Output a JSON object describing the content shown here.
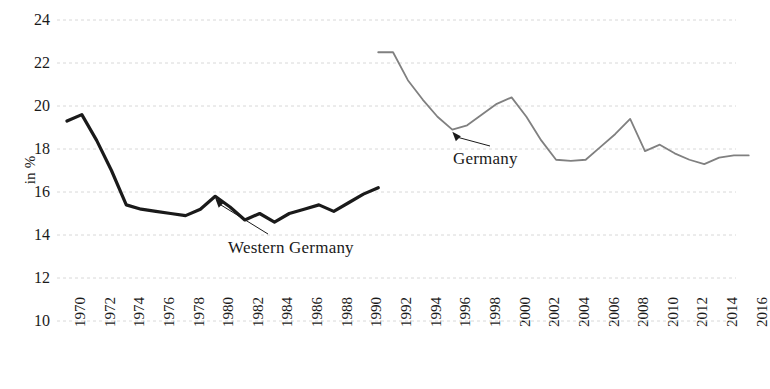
{
  "chart_data": {
    "type": "line",
    "title": "",
    "xlabel": "",
    "ylabel": "in %",
    "xlim": [
      1970,
      2016
    ],
    "ylim": [
      10,
      24
    ],
    "grid": true,
    "grid_axis": "y",
    "legend": "inline-annotations",
    "y_ticks": [
      24,
      22,
      20,
      18,
      16,
      14,
      12,
      10
    ],
    "x_ticks": [
      1970,
      1972,
      1974,
      1976,
      1978,
      1980,
      1982,
      1984,
      1986,
      1988,
      1990,
      1992,
      1994,
      1996,
      1998,
      2000,
      2002,
      2004,
      2006,
      2008,
      2010,
      2012,
      2014,
      2016
    ],
    "series": [
      {
        "name": "Western Germany",
        "color": "#1a1a1a",
        "width": 3.2,
        "x": [
          1970,
          1971,
          1972,
          1973,
          1974,
          1975,
          1976,
          1977,
          1978,
          1979,
          1980,
          1981,
          1982,
          1983,
          1984,
          1985,
          1986,
          1987,
          1988,
          1989,
          1990,
          1991
        ],
        "values": [
          19.3,
          19.6,
          18.4,
          17.0,
          15.4,
          15.2,
          15.1,
          15.0,
          14.9,
          15.2,
          15.8,
          15.3,
          14.7,
          15.0,
          14.6,
          15.0,
          15.2,
          15.4,
          15.1,
          15.5,
          15.9,
          16.2
        ]
      },
      {
        "name": "Germany",
        "color": "#808080",
        "width": 1.8,
        "x": [
          1991,
          1992,
          1993,
          1994,
          1995,
          1996,
          1997,
          1998,
          1999,
          2000,
          2001,
          2002,
          2003,
          2004,
          2005,
          2006,
          2007,
          2008,
          2009,
          2010,
          2011,
          2012,
          2013,
          2014,
          2015,
          2016
        ],
        "values": [
          22.5,
          22.5,
          21.2,
          20.3,
          19.5,
          18.9,
          19.1,
          19.6,
          20.1,
          20.4,
          19.5,
          18.4,
          17.5,
          17.45,
          17.5,
          18.1,
          18.7,
          19.4,
          17.9,
          18.2,
          17.8,
          17.5,
          17.3,
          17.6,
          17.7,
          17.7
        ]
      }
    ],
    "annotations": [
      {
        "text": "Western Germany",
        "points_to_year": 1980,
        "points_to_value": 15.8,
        "series": "Western Germany"
      },
      {
        "text": "Germany",
        "points_to_year": 1996,
        "points_to_value": 18.9,
        "series": "Germany"
      }
    ]
  },
  "axes": {
    "y_title": "in %",
    "y_tick_labels": [
      "24",
      "22",
      "20",
      "18",
      "16",
      "14",
      "12",
      "10"
    ],
    "x_tick_labels": [
      "1970",
      "1972",
      "1974",
      "1976",
      "1978",
      "1980",
      "1982",
      "1984",
      "1986",
      "1988",
      "1990",
      "1992",
      "1994",
      "1996",
      "1998",
      "2000",
      "2002",
      "2004",
      "2006",
      "2008",
      "2010",
      "2012",
      "2014",
      "2016"
    ]
  },
  "annotations": {
    "western_germany": "Western Germany",
    "germany": "Germany"
  },
  "colors": {
    "western_germany_line": "#1a1a1a",
    "germany_line": "#808080",
    "gridline": "#d8d8d8",
    "text": "#1a1a1a",
    "background": "#ffffff"
  }
}
